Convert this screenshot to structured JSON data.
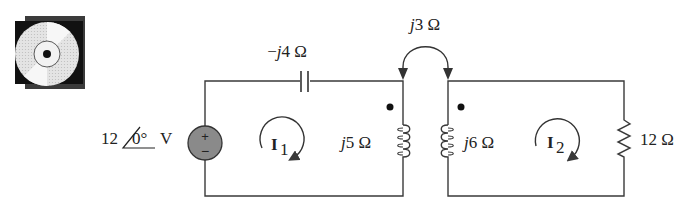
{
  "icon": {
    "name": "cd-rom-icon"
  },
  "circuit": {
    "source": {
      "magnitude": "12",
      "angle": "0°",
      "unit": "V",
      "plus": "+",
      "minus": "−",
      "fill": "#8a8a8a"
    },
    "capacitor": {
      "prefix": "−",
      "j": "j",
      "value": "4 Ω"
    },
    "mutual": {
      "j": "j",
      "value": "3 Ω"
    },
    "inductor_left": {
      "j": "j",
      "value": "5 Ω"
    },
    "inductor_right": {
      "j": "j",
      "value": "6 Ω"
    },
    "resistor": {
      "value": "12 Ω"
    },
    "mesh1": {
      "symbol": "I",
      "subscript": "1"
    },
    "mesh2": {
      "symbol": "I",
      "subscript": "2"
    }
  }
}
